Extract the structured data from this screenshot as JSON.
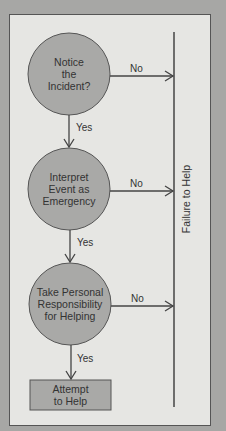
{
  "colors": {
    "background": "#a7a7a5",
    "panel": "#e6e6e3",
    "node_fill": "#a9a9a7",
    "line": "#444444",
    "text": "#333333"
  },
  "nodes": [
    {
      "id": "notice",
      "shape": "circle",
      "label": "Notice\nthe\nIncident?"
    },
    {
      "id": "interpret",
      "shape": "circle",
      "label": "Interpret\nEvent as\nEmergency"
    },
    {
      "id": "responsibility",
      "shape": "circle",
      "label": "Take Personal\nResponsibility\nfor Helping"
    },
    {
      "id": "attempt",
      "shape": "rectangle",
      "label": "Attempt\nto Help"
    }
  ],
  "edges": [
    {
      "from": "notice",
      "to": "failure",
      "label": "No"
    },
    {
      "from": "notice",
      "to": "interpret",
      "label": "Yes"
    },
    {
      "from": "interpret",
      "to": "failure",
      "label": "No"
    },
    {
      "from": "interpret",
      "to": "responsibility",
      "label": "Yes"
    },
    {
      "from": "responsibility",
      "to": "failure",
      "label": "No"
    },
    {
      "from": "responsibility",
      "to": "attempt",
      "label": "Yes"
    }
  ],
  "failure_bar": {
    "label": "Failure to Help"
  }
}
